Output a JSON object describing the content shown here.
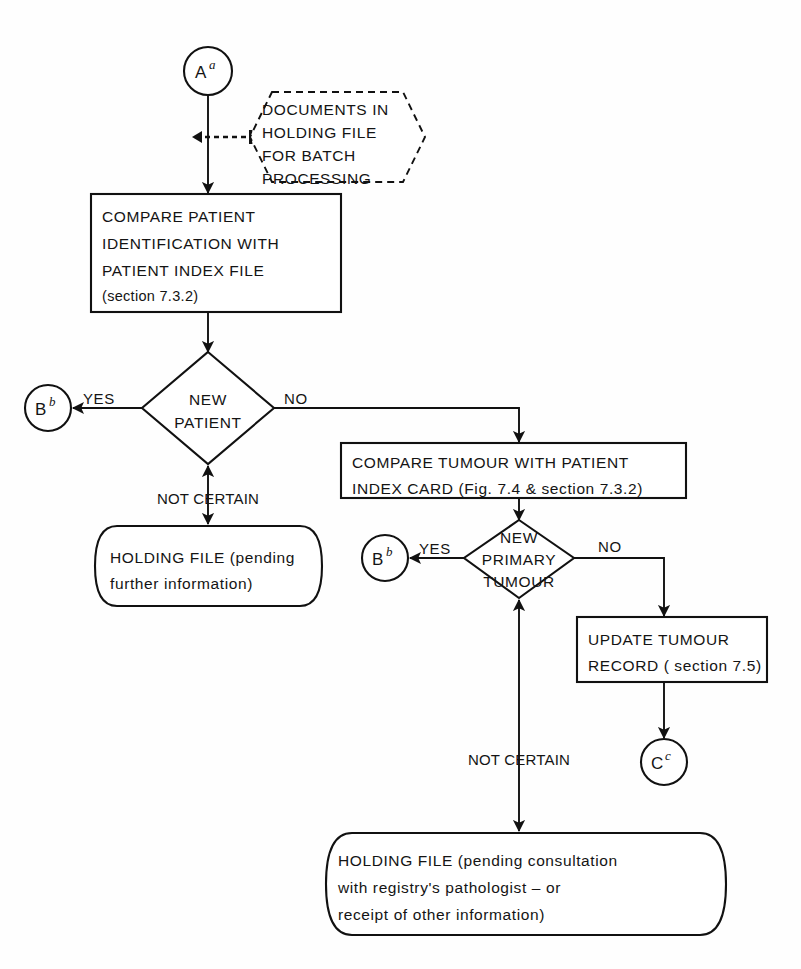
{
  "figure": {
    "kind": "flowchart",
    "background": "#ffffff",
    "line_color": "#111111",
    "text_color": "#141414"
  },
  "connectors": {
    "a": {
      "letter": "A",
      "superscript": "a"
    },
    "b_top": {
      "letter": "B",
      "superscript": "b"
    },
    "b_mid": {
      "letter": "B",
      "superscript": "b"
    },
    "c": {
      "letter": "C",
      "superscript": "c"
    }
  },
  "annotation_note": {
    "lines": [
      "DOCUMENTS IN",
      "HOLDING     FILE",
      "FOR BATCH",
      "PROCESSING"
    ]
  },
  "process_compare_patient": {
    "lines": [
      "COMPARE         PATIENT",
      "IDENTIFICATION    WITH",
      "PATIENT   INDEX   FILE",
      "(section 7.3.2)"
    ]
  },
  "decision_new_patient": {
    "lines": [
      "NEW",
      "PATIENT"
    ],
    "branch_yes": "YES",
    "branch_no": "NO",
    "branch_not_certain": "NOT CERTAIN"
  },
  "terminal_holding_file_1": {
    "lines": [
      "HOLDING FILE   (pending",
      "further    information)"
    ]
  },
  "process_compare_tumour": {
    "lines": [
      "COMPARE TUMOUR WITH   PATIENT",
      "INDEX CARD (Fig. 7.4 & section 7.3.2)"
    ]
  },
  "decision_new_primary_tumour": {
    "lines": [
      "NEW",
      "PRIMARY",
      "TUMOUR"
    ],
    "branch_yes": "YES",
    "branch_no": "NO",
    "branch_not_certain": "NOT CERTAIN"
  },
  "process_update_tumour": {
    "lines": [
      "UPDATE   TUMOUR",
      "RECORD ( section 7.5)"
    ]
  },
  "terminal_holding_file_2": {
    "lines": [
      "HOLDING   FILE  (pending consultation",
      "with    registry's   pathologist    –    or",
      "receipt     of      other        information)"
    ]
  }
}
